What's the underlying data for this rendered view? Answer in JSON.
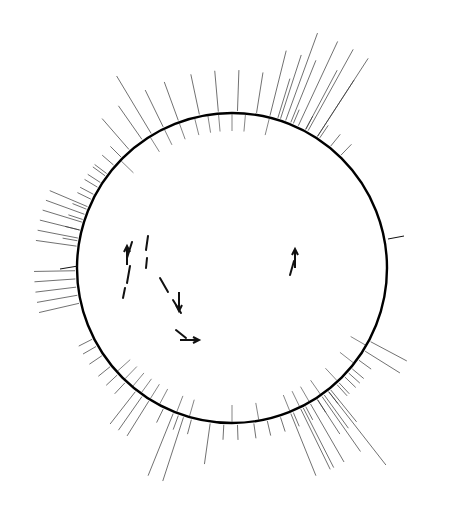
{
  "figure": {
    "kind": "circular-genetic-linkage-map",
    "organism_map": "Streptomyces coelicolor chromosome map",
    "circle": {
      "cx": 232,
      "cy": 268,
      "r": 155,
      "stroke": "#000000",
      "stroke_width": 2.4
    }
  },
  "colors": {
    "ink": "#111111",
    "line": "#333333",
    "paper": "#ffffff"
  },
  "attachment_sites": [
    {
      "name": "att-VP5",
      "side": "right",
      "x": 406,
      "y": 234,
      "tick_from": [
        388,
        239
      ],
      "tick_to": [
        404,
        236
      ]
    },
    {
      "name": "dagA",
      "side": "left",
      "x": 30,
      "y": 271,
      "tick_from": [
        60,
        269
      ],
      "tick_to": [
        78,
        266
      ]
    },
    {
      "name": "att-C31",
      "side": "bottom-left",
      "x": 21,
      "y": 408,
      "rotate": -40
    }
  ],
  "interior_annotations": [
    {
      "label": "NF",
      "x": 128,
      "y": 263,
      "type": "fertility-marker"
    },
    {
      "label": "A607etc",
      "x": 152,
      "y": 248,
      "type": "deletion-arc"
    },
    {
      "label": "A608",
      "x": 152,
      "y": 259,
      "type": "deletion-arc"
    },
    {
      "label": "A610",
      "x": 166,
      "y": 288,
      "type": "deletion-arc"
    },
    {
      "label": "2106",
      "x": 285,
      "y": 290,
      "type": "deletion-arc"
    },
    {
      "label": "2293",
      "x": 183,
      "y": 342,
      "type": "deletion-arc"
    }
  ],
  "map_positions": [
    {
      "label": "54",
      "angle": -46,
      "bracket": false
    },
    {
      "label": "95",
      "angle": -32,
      "bracket": false
    },
    {
      "label": "(89)",
      "angle": -26,
      "bracket": true
    },
    {
      "label": "70",
      "angle": -20,
      "bracket": false
    },
    {
      "label": "(68)",
      "angle": -14,
      "bracket": true
    },
    {
      "label": "103",
      "angle": -9,
      "bracket": false
    },
    {
      "label": "39",
      "angle": -5,
      "bracket": false
    },
    {
      "label": "2",
      "angle": 0,
      "bracket": false
    },
    {
      "label": "48",
      "angle": 5,
      "bracket": false
    },
    {
      "label": "53",
      "angle": 14,
      "bracket": false
    },
    {
      "label": "50",
      "angle": 120,
      "bracket": false
    },
    {
      "label": "33",
      "angle": 128,
      "bracket": false
    },
    {
      "label": "102",
      "angle": 137,
      "bracket": false
    },
    {
      "label": "96",
      "angle": 145,
      "bracket": false
    },
    {
      "label": "(69)",
      "angle": 150,
      "bracket": true
    },
    {
      "label": "60",
      "angle": 154,
      "bracket": false
    },
    {
      "label": "(51)",
      "angle": 158,
      "bracket": true
    },
    {
      "label": "100",
      "angle": 170,
      "bracket": false
    },
    {
      "label": "107",
      "angle": 180,
      "bracket": false
    },
    {
      "label": "101",
      "angle": 196,
      "bracket": false
    },
    {
      "label": "(81)",
      "angle": 201,
      "bracket": true
    },
    {
      "label": "(40)",
      "angle": 208,
      "bracket": true
    },
    {
      "label": "(15)",
      "angle": 212,
      "bracket": true
    },
    {
      "label": "(16)",
      "angle": 216,
      "bracket": true
    },
    {
      "label": "(81)",
      "angle": 220,
      "bracket": true
    },
    {
      "label": "(76)",
      "angle": 224,
      "bracket": true
    },
    {
      "label": "104",
      "angle": 228,
      "bracket": false
    }
  ],
  "gene_labels": [
    {
      "label": "aroB",
      "angle": -82,
      "tier": 3
    },
    {
      "label": "lysA",
      "angle": -79,
      "tier": 3
    },
    {
      "label": "dapA",
      "angle": -76,
      "tier": 3
    },
    {
      "label": "nicB",
      "angle": -73,
      "tier": 3
    },
    {
      "label": "pyrB",
      "angle": -70,
      "tier": 3
    },
    {
      "label": "dcoA",
      "angle": -67,
      "tier": 3
    },
    {
      "label": "acrB",
      "angle": -62,
      "tier": 2
    },
    {
      "label": "guaC",
      "angle": -57,
      "tier": 2
    },
    {
      "label": "trpC,D",
      "angle": -53,
      "tier": 2
    },
    {
      "label": "phiC",
      "angle": -49,
      "tier": 2
    },
    {
      "label": "msA",
      "angle": -45,
      "tier": 2
    },
    {
      "label": "hisA,B,C,F,G,I",
      "angle": -41,
      "tier": 3
    },
    {
      "label": "trpA,B",
      "angle": -35,
      "tier": 3
    },
    {
      "label": "cos-1",
      "angle": -31,
      "tier": 4
    },
    {
      "label": "amyA",
      "angle": -26,
      "tier": 3
    },
    {
      "label": "uraA,C,D",
      "angle": -20,
      "tier": 3
    },
    {
      "label": "whiA",
      "angle": -12,
      "tier": 3
    },
    {
      "label": "serA",
      "angle": -5,
      "tier": 3
    },
    {
      "label": "hisM,B",
      "angle": 2,
      "tier": 3
    },
    {
      "label": "nicB",
      "angle": 9,
      "tier": 3
    },
    {
      "label": "pldA",
      "angle": 14,
      "tier": 4
    },
    {
      "label": "phiA",
      "angle": 18,
      "tier": 4
    },
    {
      "label": "guiB",
      "angle": 22,
      "tier": 4
    },
    {
      "label": "argA,B,C",
      "angle": 17,
      "tier": 3
    },
    {
      "label": "glyE",
      "angle": 23,
      "tier": 2
    },
    {
      "label": "uraB,C,D",
      "angle": 28,
      "tier": 2
    },
    {
      "label": "hisA",
      "angle": 34,
      "tier": 2
    },
    {
      "label": "cos-2",
      "angle": 39,
      "tier": 2
    },
    {
      "label": "hisF",
      "angle": 44,
      "tier": 2
    },
    {
      "label": "nicB",
      "angle": 28,
      "tier": 4
    },
    {
      "label": "proA",
      "angle": 33,
      "tier": 4
    },
    {
      "label": "acbA",
      "angle": 20,
      "tier": 5
    },
    {
      "label": "pabA",
      "angle": 25,
      "tier": 5
    },
    {
      "label": "aroC",
      "angle": 29,
      "tier": 5
    },
    {
      "label": "genA",
      "angle": 33,
      "tier": 5
    },
    {
      "label": "novA",
      "angle": -103,
      "tier": 3
    },
    {
      "label": "whiB",
      "angle": -100,
      "tier": 3
    },
    {
      "label": "bldA",
      "angle": -97,
      "tier": 3
    },
    {
      "label": "ageC",
      "angle": -94,
      "tier": 3
    },
    {
      "label": "pel",
      "angle": -91,
      "tier": 3
    },
    {
      "label": "leuA",
      "angle": -80,
      "tier": 2
    },
    {
      "label": "proA",
      "angle": -76,
      "tier": 2
    },
    {
      "label": "gyaA",
      "angle": -72,
      "tier": 2
    },
    {
      "label": "agaA",
      "angle": -68,
      "tier": 2
    },
    {
      "label": "ilvM",
      "angle": -64,
      "tier": 2
    },
    {
      "label": "nicA",
      "angle": -59,
      "tier": 2
    },
    {
      "label": "pabA",
      "angle": -54,
      "tier": 2
    },
    {
      "label": "aroA",
      "angle": 243,
      "tier": 2
    },
    {
      "label": "argG",
      "angle": 240,
      "tier": 2
    },
    {
      "label": "pyrB",
      "angle": 236,
      "tier": 2
    },
    {
      "label": "pheA",
      "angle": 231,
      "tier": 2
    },
    {
      "label": "adhA",
      "angle": 227,
      "tier": 2
    },
    {
      "label": "adaA",
      "angle": 223,
      "tier": 2
    },
    {
      "label": "ribA",
      "angle": 218,
      "tier": 3
    },
    {
      "label": "bldC",
      "angle": 215,
      "tier": 3
    },
    {
      "label": "cysB",
      "angle": 212,
      "tier": 3
    },
    {
      "label": "gtaB",
      "angle": 206,
      "tier": 2
    },
    {
      "label": "gtaE",
      "angle": 200,
      "tier": 2
    },
    {
      "label": "whiC",
      "angle": 195,
      "tier": 2
    },
    {
      "label": "rifA",
      "angle": 188,
      "tier": 3
    },
    {
      "label": "btnB",
      "angle": 183,
      "tier": 2
    },
    {
      "label": "hpdA",
      "angle": 178,
      "tier": 2
    },
    {
      "label": "whiD",
      "angle": 172,
      "tier": 2
    },
    {
      "label": "adeB",
      "angle": 167,
      "tier": 2
    },
    {
      "label": "guaA",
      "angle": 162,
      "tier": 2
    },
    {
      "label": "argB,E",
      "angle": 157,
      "tier": 2
    },
    {
      "label": "hisD",
      "angle": 152,
      "tier": 2
    },
    {
      "label": "whiE",
      "angle": 147,
      "tier": 2
    },
    {
      "label": "argA,B",
      "angle": 142,
      "tier": 2
    },
    {
      "label": "hisL,D",
      "angle": 137,
      "tier": 2
    },
    {
      "label": "guaB",
      "angle": 132,
      "tier": 2
    },
    {
      "label": "phrA,B",
      "angle": 145,
      "tier": 4
    },
    {
      "label": "act-I,II",
      "angle": 153,
      "tier": 4
    },
    {
      "label": "ora",
      "angle": 118,
      "tier": 3
    },
    {
      "label": "phi(C31)R",
      "angle": 122,
      "tier": 3
    },
    {
      "label": "wdsP",
      "angle": 126,
      "tier": 2
    },
    {
      "label": "argD",
      "angle": 130,
      "tier": 2
    },
    {
      "label": "argC,J",
      "angle": 134,
      "tier": 2
    },
    {
      "label": "whiI",
      "angle": 138,
      "tier": 2
    },
    {
      "label": "whiH",
      "angle": 141,
      "tier": 3
    },
    {
      "label": "hisB",
      "angle": 144,
      "tier": 3
    },
    {
      "label": "phiF,G",
      "angle": 147,
      "tier": 3
    },
    {
      "label": "redA,B,C,D,E",
      "angle": 142,
      "tier": 5
    },
    {
      "label": "cys-3",
      "angle": 150,
      "tier": 4
    },
    {
      "label": "ileA",
      "angle": 154,
      "tier": 4
    },
    {
      "label": "cysD",
      "angle": 158,
      "tier": 4
    },
    {
      "label": "nic-",
      "angle": 202,
      "tier": 4
    },
    {
      "label": "uvs-53",
      "angle": 198,
      "tier": 4
    }
  ]
}
